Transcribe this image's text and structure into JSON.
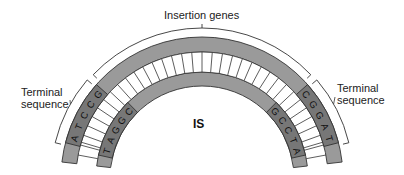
{
  "labels": {
    "insertion_genes": "Insertion genes",
    "terminal_left": [
      "Terminal",
      "sequence"
    ],
    "terminal_right": [
      "Terminal",
      "sequence"
    ],
    "center": "IS"
  },
  "strands": {
    "outer_left_terminal": [
      "A",
      "T",
      "C",
      "C",
      "G"
    ],
    "inner_left_terminal": [
      "T",
      "A",
      "G",
      "G",
      "C"
    ],
    "outer_right_terminal": [
      "C",
      "G",
      "G",
      "A",
      "T"
    ],
    "inner_right_terminal": [
      "G",
      "C",
      "C",
      "T",
      "A"
    ]
  },
  "colors": {
    "strand": "#9a9a9a",
    "terminal_segment": "#777777",
    "rung": "#ffffff",
    "outline": "#333333",
    "bracket": "#333333",
    "text": "#222222"
  }
}
